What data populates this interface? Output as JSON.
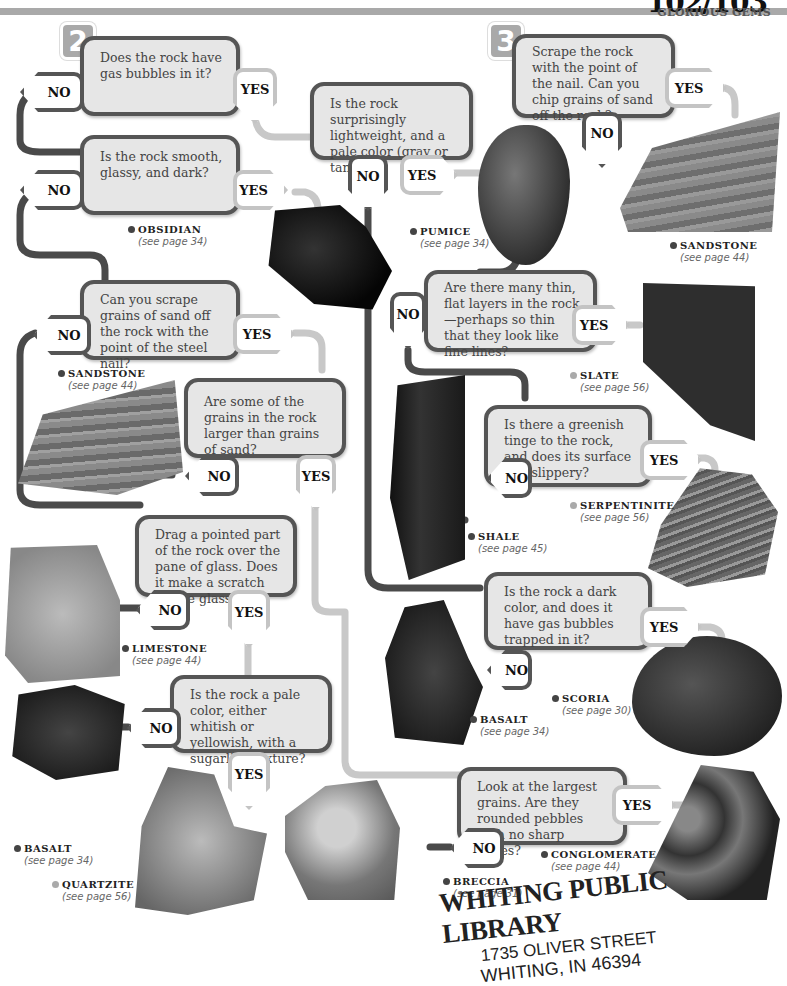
{
  "header": {
    "page_number": "102/103",
    "section_title": "GLORIOUS GEMS"
  },
  "steps": [
    "2",
    "3"
  ],
  "tags": {
    "yes": "YES",
    "no": "NO"
  },
  "questions": {
    "q1": "Does the rock have gas bubbles in it?",
    "q2": "Is the rock surprisingly lightweight, and a pale color (gray or tan)?",
    "q3": "Is the rock smooth, glassy, and dark?",
    "q4": "Can you scrape grains of sand off the rock with the point of the steel nail?",
    "q5": "Are some of the grains in the rock larger than grains of sand?",
    "q6": "Drag a pointed part of the rock over the pane of glass. Does it make a scratch on the glass?",
    "q7": "Is the rock a pale color, either whitish or yellowish, with a sugarlike texture?",
    "q8": "Look at the largest grains. Are they rounded pebbles with no sharp edges?",
    "q9": "Scrape the rock with the point of the nail. Can you chip grains of sand off the rock?",
    "q10": "Are there many thin, flat layers in the rock—perhaps so thin that they look like fine lines?",
    "q11": "Is there a greenish tinge to the rock, and does its surface feel slippery?",
    "q12": "Is the rock a dark color, and does it have gas bubbles trapped in it?"
  },
  "rocks": {
    "obsidian": {
      "name": "OBSIDIAN",
      "ref": "(see page 34)"
    },
    "pumice": {
      "name": "PUMICE",
      "ref": "(see page 34)"
    },
    "sandstone_right": {
      "name": "SANDSTONE",
      "ref": "(see page 44)"
    },
    "sandstone_left": {
      "name": "SANDSTONE",
      "ref": "(see page 44)"
    },
    "slate": {
      "name": "SLATE",
      "ref": "(see page 56)"
    },
    "serpentinite": {
      "name": "SERPENTINITE",
      "ref": "(see page 56)"
    },
    "shale": {
      "name": "SHALE",
      "ref": "(see page 45)"
    },
    "limestone": {
      "name": "LIMESTONE",
      "ref": "(see page 44)"
    },
    "scoria": {
      "name": "SCORIA",
      "ref": "(see page 30)"
    },
    "basalt_mid": {
      "name": "BASALT",
      "ref": "(see page 34)"
    },
    "basalt_left": {
      "name": "BASALT",
      "ref": "(see page 34)"
    },
    "quartzite": {
      "name": "QUARTZITE",
      "ref": "(see page 56)"
    },
    "breccia": {
      "name": "BRECCIA",
      "ref": "(see page 31)"
    },
    "conglomerate": {
      "name": "CONGLOMERATE",
      "ref": "(see page 44)"
    }
  },
  "stamp": {
    "line1": "WHITING PUBLIC LIBRARY",
    "line2": "1735 OLIVER STREET",
    "line3": "WHITING, IN 46394"
  },
  "colors": {
    "dark_path": "#4a4a4a",
    "light_path": "#c8c8c8",
    "box_fill": "#e6e6e6"
  }
}
